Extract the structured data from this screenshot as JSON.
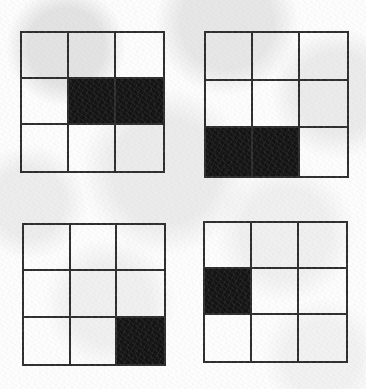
{
  "figure": {
    "type": "grid-pattern-set",
    "grid_rows": 3,
    "grid_columns": 3,
    "fill_color": "#141414",
    "line_color": "#2b2b2b",
    "background_color": "#fdfdfd",
    "panel_count": 4,
    "panels": [
      {
        "id": "figure-1",
        "position": "top-left",
        "filled_cells": [
          {
            "row": 2,
            "col": 2
          },
          {
            "row": 2,
            "col": 3
          }
        ],
        "cells": [
          [
            0,
            0,
            0
          ],
          [
            0,
            1,
            1
          ],
          [
            0,
            0,
            0
          ]
        ]
      },
      {
        "id": "figure-2",
        "position": "top-right",
        "filled_cells": [
          {
            "row": 3,
            "col": 1
          },
          {
            "row": 3,
            "col": 2
          }
        ],
        "cells": [
          [
            0,
            0,
            0
          ],
          [
            0,
            0,
            0
          ],
          [
            1,
            1,
            0
          ]
        ]
      },
      {
        "id": "figure-3",
        "position": "bottom-left",
        "filled_cells": [
          {
            "row": 3,
            "col": 3
          }
        ],
        "cells": [
          [
            0,
            0,
            0
          ],
          [
            0,
            0,
            0
          ],
          [
            0,
            0,
            1
          ]
        ]
      },
      {
        "id": "figure-4",
        "position": "bottom-right",
        "filled_cells": [
          {
            "row": 2,
            "col": 1
          }
        ],
        "cells": [
          [
            0,
            0,
            0
          ],
          [
            1,
            0,
            0
          ],
          [
            0,
            0,
            0
          ]
        ]
      }
    ]
  }
}
